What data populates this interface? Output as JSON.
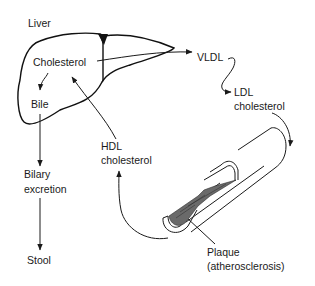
{
  "diagram": {
    "labels": {
      "liver": "Liver",
      "cholesterol": "Cholesterol",
      "bile": "Bile",
      "biliary_line1": "Bilary",
      "biliary_line2": "excretion",
      "stool": "Stool",
      "vldl": "VLDL",
      "ldl_line1": "LDL",
      "ldl_line2": "cholesterol",
      "hdl_line1": "HDL",
      "hdl_line2": "cholesterol",
      "plaque_line1": "Plaque",
      "plaque_line2": "(atherosclerosis)"
    },
    "colors": {
      "ink": "#1a1a1a",
      "plaque_fill": "#6a6a6a",
      "background": "#ffffff"
    }
  }
}
